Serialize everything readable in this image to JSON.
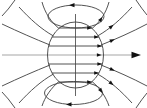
{
  "figure": {
    "canvas": {
      "width": 147,
      "height": 108
    },
    "colors": {
      "background": "#ffffff",
      "field_line": "#3f3f3f",
      "axis_line": "#a6a6a6",
      "arrowhead": "#111111"
    },
    "lines": [
      {
        "name": "central-axis",
        "kind": "line",
        "x1": 2,
        "y1": 55,
        "x2": 133,
        "y2": 55,
        "stroke": "axis_line",
        "w": 1.2
      },
      {
        "name": "top-loop",
        "kind": "ellipse",
        "cx": 76,
        "cy": 16.5,
        "rx": 28,
        "ry": 11.5
      },
      {
        "name": "bottom-loop",
        "kind": "ellipse",
        "cx": 73.5,
        "cy": 93,
        "rx": 29,
        "ry": 11.5
      },
      {
        "name": "external-field-line-top-right-1",
        "kind": "path",
        "d": "M92,28.5 C100,22 106,13 109,2"
      },
      {
        "name": "external-field-line-top-right-2",
        "kind": "path",
        "d": "M97.5,36 C110,29 121,19 132,7"
      },
      {
        "name": "external-field-line-top-right-3",
        "kind": "path",
        "d": "M101,45 C116,39 132,32 147,24"
      },
      {
        "name": "external-field-line-top-right-corner",
        "kind": "path",
        "d": "M136,0 Q142,9 147,15"
      },
      {
        "name": "external-field-line-top-left-1",
        "kind": "path",
        "d": "M59,28.5 C51,22 45,13 42,2"
      },
      {
        "name": "external-field-line-top-left-2",
        "kind": "path",
        "d": "M53.5,36 C41,29 30,19 19,7"
      },
      {
        "name": "external-field-line-top-left-3",
        "kind": "path",
        "d": "M50,45 C35,39 19,32 2,24"
      },
      {
        "name": "external-field-line-top-left-corner",
        "kind": "path",
        "d": "M15,0 Q8,10 2,16"
      },
      {
        "name": "external-field-line-bottom-right-1",
        "kind": "path",
        "d": "M92,81.5 C100,88 106,97 109,106"
      },
      {
        "name": "external-field-line-bottom-right-2",
        "kind": "path",
        "d": "M97.5,74 C110,81 121,91 132,103"
      },
      {
        "name": "external-field-line-bottom-right-3",
        "kind": "path",
        "d": "M101,65 C116,71 132,78 147,86"
      },
      {
        "name": "external-field-line-bottom-right-corner",
        "kind": "path",
        "d": "M136,108 Q142,99 147,93"
      },
      {
        "name": "external-field-line-bottom-left-1",
        "kind": "path",
        "d": "M59,81.5 C51,88 45,97 42,106"
      },
      {
        "name": "external-field-line-bottom-left-2",
        "kind": "path",
        "d": "M53.5,74 C41,81 30,91 19,103"
      },
      {
        "name": "external-field-line-bottom-left-3",
        "kind": "path",
        "d": "M50,65 C35,71 19,78 2,86"
      },
      {
        "name": "external-field-line-bottom-left-corner",
        "kind": "path",
        "d": "M15,108 Q8,98 2,92"
      },
      {
        "name": "sphere-outline",
        "kind": "ellipse",
        "cx": 75.5,
        "cy": 55,
        "rx": 28,
        "ry": 33
      },
      {
        "name": "vertical-diameter",
        "kind": "line",
        "x1": 75.5,
        "y1": 14,
        "x2": 75.5,
        "y2": 96,
        "w": 0.8
      },
      {
        "name": "internal-field-line-1",
        "kind": "line",
        "x1": 59,
        "y1": 28,
        "x2": 92,
        "y2": 28
      },
      {
        "name": "internal-field-line-2",
        "kind": "line",
        "x1": 52,
        "y1": 37,
        "x2": 99,
        "y2": 37
      },
      {
        "name": "internal-field-line-3",
        "kind": "line",
        "x1": 48.6,
        "y1": 46,
        "x2": 102.4,
        "y2": 46
      },
      {
        "name": "internal-field-line-4",
        "kind": "line",
        "x1": 48.6,
        "y1": 64,
        "x2": 102.4,
        "y2": 64
      },
      {
        "name": "internal-field-line-5",
        "kind": "line",
        "x1": 52,
        "y1": 73,
        "x2": 99,
        "y2": 73
      },
      {
        "name": "internal-field-line-6",
        "kind": "line",
        "x1": 59,
        "y1": 82,
        "x2": 92,
        "y2": 82
      }
    ],
    "arrows": [
      {
        "name": "axis-arrowhead",
        "x": 141,
        "y": 55,
        "angle": 0,
        "len": 9.5,
        "half": 3.2
      },
      {
        "name": "internal-arrowhead-1",
        "x": 91.8,
        "y": 28,
        "angle": 0,
        "len": 4.6,
        "half": 1.8
      },
      {
        "name": "internal-arrowhead-2",
        "x": 98.8,
        "y": 37,
        "angle": 0,
        "len": 4.6,
        "half": 1.8
      },
      {
        "name": "internal-arrowhead-3",
        "x": 102,
        "y": 46,
        "angle": 0,
        "len": 4.6,
        "half": 1.8
      },
      {
        "name": "internal-arrowhead-axis",
        "x": 101.5,
        "y": 55,
        "angle": 0,
        "len": 4.6,
        "half": 1.8
      },
      {
        "name": "internal-arrowhead-4",
        "x": 102,
        "y": 64,
        "angle": 0,
        "len": 4.6,
        "half": 1.8
      },
      {
        "name": "internal-arrowhead-5",
        "x": 98.8,
        "y": 73,
        "angle": 0,
        "len": 4.6,
        "half": 1.8
      },
      {
        "name": "internal-arrowhead-6",
        "x": 91.8,
        "y": 82,
        "angle": 0,
        "len": 4.6,
        "half": 1.8
      },
      {
        "name": "top-loop-arrowhead",
        "x": 69,
        "y": 5.2,
        "angle": 180,
        "len": 5.5,
        "half": 2.1
      },
      {
        "name": "bottom-loop-arrowhead",
        "x": 66,
        "y": 104.4,
        "angle": 180,
        "len": 5.5,
        "half": 2.1
      },
      {
        "name": "top-right-arrowhead-1",
        "x": 102.4,
        "y": 16.9,
        "angle": -57,
        "len": 5,
        "half": 1.9
      },
      {
        "name": "top-right-arrowhead-2",
        "x": 113.5,
        "y": 24.8,
        "angle": -40,
        "len": 5,
        "half": 1.9
      },
      {
        "name": "top-right-arrowhead-3",
        "x": 114.7,
        "y": 39.3,
        "angle": -23,
        "len": 5,
        "half": 1.9
      },
      {
        "name": "bottom-right-arrowhead-1",
        "x": 102.4,
        "y": 93.1,
        "angle": 57,
        "len": 5,
        "half": 1.9
      },
      {
        "name": "bottom-right-arrowhead-2",
        "x": 113.5,
        "y": 85.2,
        "angle": 40,
        "len": 5,
        "half": 1.9
      },
      {
        "name": "bottom-right-arrowhead-3",
        "x": 114.7,
        "y": 70.7,
        "angle": 23,
        "len": 5,
        "half": 1.9
      }
    ]
  }
}
